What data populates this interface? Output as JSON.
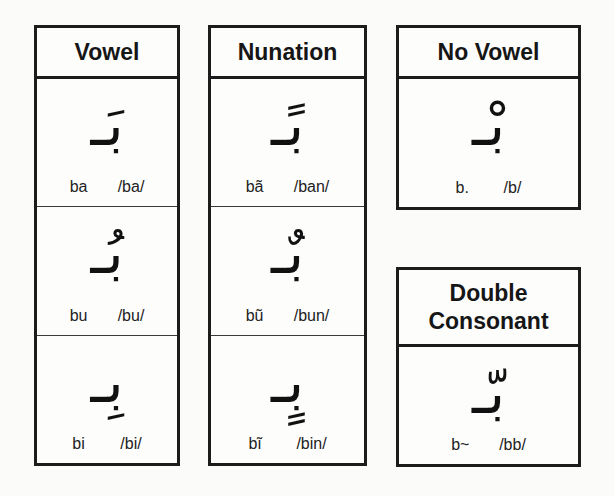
{
  "columns": [
    {
      "title": "Vowel",
      "rows": [
        {
          "glyph": "بَـ",
          "translit": "ba",
          "ipa": "/ba/"
        },
        {
          "glyph": "بُـ",
          "translit": "bu",
          "ipa": "/bu/"
        },
        {
          "glyph": "بِـ",
          "translit": "bi",
          "ipa": "/bi/"
        }
      ]
    },
    {
      "title": "Nunation",
      "rows": [
        {
          "glyph": "بًـ",
          "translit": "bã",
          "ipa": "/ban/"
        },
        {
          "glyph": "بٌـ",
          "translit": "bũ",
          "ipa": "/bun/"
        },
        {
          "glyph": "بٍـ",
          "translit": "bĩ",
          "ipa": "/bin/"
        }
      ]
    }
  ],
  "no_vowel": {
    "title": "No Vowel",
    "glyph": "بْـ",
    "translit": "b.",
    "ipa": "/b/"
  },
  "double_consonant": {
    "title_line1": "Double",
    "title_line2": "Consonant",
    "glyph": "بّـ",
    "translit": "b~",
    "ipa": "/bb/"
  }
}
